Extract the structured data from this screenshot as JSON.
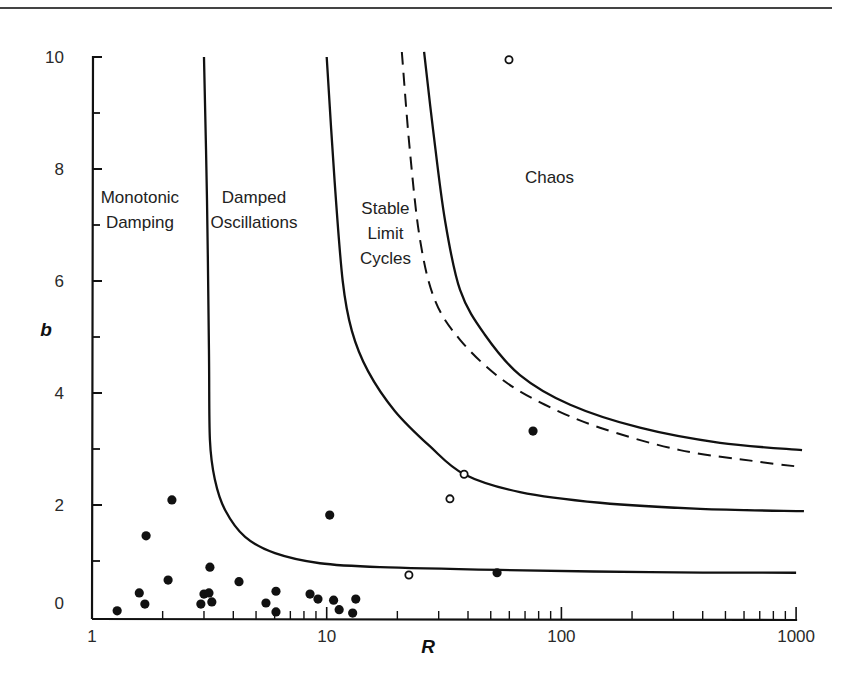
{
  "chart_data": {
    "type": "scatter",
    "title": "",
    "xlabel": "R",
    "ylabel": "b",
    "x_scale": "log",
    "xlim": [
      1,
      1000
    ],
    "ylim": [
      0,
      10
    ],
    "grid": false,
    "legend": null,
    "x_ticks": [
      {
        "value": 1,
        "label": "1"
      },
      {
        "value": 10,
        "label": "10"
      },
      {
        "value": 100,
        "label": "100"
      },
      {
        "value": 1000,
        "label": "1000"
      }
    ],
    "y_ticks": [
      {
        "value": 0,
        "label": "0"
      },
      {
        "value": 2,
        "label": "2"
      },
      {
        "value": 4,
        "label": "4"
      },
      {
        "value": 6,
        "label": "6"
      },
      {
        "value": 8,
        "label": "8"
      },
      {
        "value": 10,
        "label": "10"
      }
    ],
    "y_minor_ticks": [
      1,
      3,
      5,
      7,
      9
    ],
    "regions": [
      {
        "label_lines": [
          "Monotonic",
          "Damping"
        ],
        "R": 1.6,
        "b": 7.4
      },
      {
        "label_lines": [
          "Damped",
          "Oscillations"
        ],
        "R": 4.9,
        "b": 7.4
      },
      {
        "label_lines": [
          "Stable",
          "Limit",
          "Cycles"
        ],
        "R": 17.8,
        "b": 7.2
      },
      {
        "label_lines": [
          "Chaos"
        ],
        "R": 89,
        "b": 7.75
      }
    ],
    "boundaries": [
      {
        "name": "monotonic-damped-boundary",
        "style": "solid",
        "points": [
          [
            3.0,
            10.0
          ],
          [
            3.09,
            7.45
          ],
          [
            3.15,
            4.77
          ],
          [
            3.18,
            3.16
          ],
          [
            3.34,
            2.45
          ],
          [
            3.69,
            1.91
          ],
          [
            4.49,
            1.43
          ],
          [
            6.02,
            1.14
          ],
          [
            9.36,
            0.96
          ],
          [
            16.9,
            0.89
          ],
          [
            54.7,
            0.84
          ],
          [
            238,
            0.8
          ],
          [
            1000,
            0.79
          ]
        ]
      },
      {
        "name": "damped-limitcycle-boundary",
        "style": "solid",
        "points": [
          [
            10.0,
            10.0
          ],
          [
            10.8,
            7.8
          ],
          [
            11.7,
            6.0
          ],
          [
            12.8,
            5.11
          ],
          [
            15.0,
            4.39
          ],
          [
            19.5,
            3.68
          ],
          [
            27.5,
            3.05
          ],
          [
            38.5,
            2.55
          ],
          [
            66.6,
            2.23
          ],
          [
            146,
            2.04
          ],
          [
            390,
            1.93
          ],
          [
            1080,
            1.89
          ]
        ]
      },
      {
        "name": "intermediate-boundary",
        "style": "dashed",
        "points": [
          [
            20.9,
            10.09
          ],
          [
            22.6,
            8.34
          ],
          [
            25.0,
            6.73
          ],
          [
            28.9,
            5.66
          ],
          [
            37.0,
            4.95
          ],
          [
            54.7,
            4.27
          ],
          [
            85.1,
            3.79
          ],
          [
            146,
            3.38
          ],
          [
            320,
            2.98
          ],
          [
            702,
            2.77
          ],
          [
            1050,
            2.68
          ]
        ]
      },
      {
        "name": "limitcycle-chaos-boundary",
        "style": "solid",
        "points": [
          [
            26.0,
            10.09
          ],
          [
            28.4,
            8.7
          ],
          [
            31.9,
            7.09
          ],
          [
            37.0,
            5.84
          ],
          [
            47.2,
            5.04
          ],
          [
            66.6,
            4.32
          ],
          [
            109,
            3.79
          ],
          [
            216,
            3.38
          ],
          [
            474,
            3.11
          ],
          [
            1060,
            2.98
          ]
        ]
      }
    ],
    "series": [
      {
        "name": "filled",
        "marker": "filled-circle",
        "points": [
          [
            1.28,
            0.11
          ],
          [
            1.59,
            0.43
          ],
          [
            1.68,
            0.23
          ],
          [
            1.7,
            1.45
          ],
          [
            2.11,
            0.66
          ],
          [
            2.19,
            2.09
          ],
          [
            2.91,
            0.23
          ],
          [
            3.0,
            0.41
          ],
          [
            3.15,
            0.43
          ],
          [
            3.24,
            0.27
          ],
          [
            3.18,
            0.89
          ],
          [
            4.23,
            0.63
          ],
          [
            5.51,
            0.25
          ],
          [
            6.08,
            0.46
          ],
          [
            6.08,
            0.09
          ],
          [
            8.49,
            0.41
          ],
          [
            9.18,
            0.32
          ],
          [
            10.7,
            0.3
          ],
          [
            11.3,
            0.13
          ],
          [
            13.3,
            0.32
          ],
          [
            12.9,
            0.07
          ],
          [
            10.3,
            1.82
          ],
          [
            53.2,
            0.79
          ],
          [
            75.7,
            3.32
          ]
        ]
      },
      {
        "name": "open",
        "marker": "open-circle",
        "points": [
          [
            22.4,
            0.75
          ],
          [
            33.5,
            2.11
          ],
          [
            38.5,
            2.55
          ],
          [
            59.8,
            9.95
          ]
        ]
      }
    ]
  }
}
